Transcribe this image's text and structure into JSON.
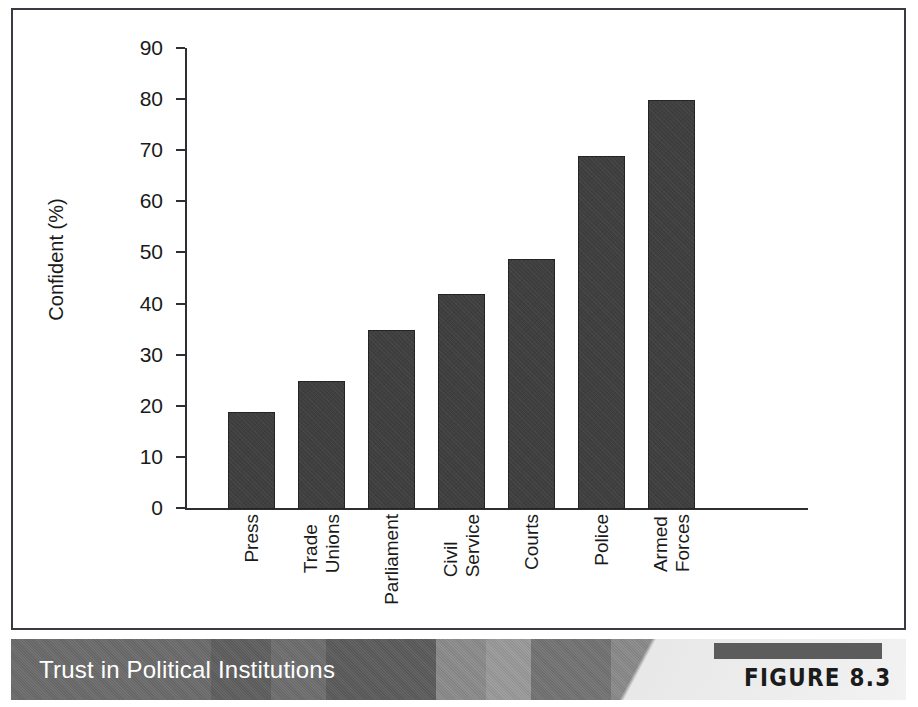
{
  "figure": {
    "caption": "Trust in Political Institutions",
    "tag": "FIGURE 8.3",
    "caption_text_color": "#ffffff",
    "caption_bar_color": "#6f6f6f",
    "tag_text_color": "#1b1b1b"
  },
  "chart_data": {
    "type": "bar",
    "title": "Trust in Political Institutions",
    "xlabel": "",
    "ylabel": "Confident (%)",
    "categories": [
      "Press",
      "Trade Unions",
      "Parliament",
      "Civil Service",
      "Courts",
      "Police",
      "Armed Forces"
    ],
    "category_lines": [
      [
        "Press"
      ],
      [
        "Trade",
        "Unions"
      ],
      [
        "Parliament"
      ],
      [
        "Civil",
        "Service"
      ],
      [
        "Courts"
      ],
      [
        "Police"
      ],
      [
        "Armed",
        "Forces"
      ]
    ],
    "values": [
      19,
      25,
      35,
      42,
      49,
      69,
      80
    ],
    "ylim": [
      0,
      90
    ],
    "yticks": [
      0,
      10,
      20,
      30,
      40,
      50,
      60,
      70,
      80,
      90
    ],
    "ytick_labels": [
      "0",
      "10",
      "20",
      "30",
      "40",
      "50",
      "60",
      "70",
      "80",
      "90"
    ],
    "grid": false,
    "legend": null,
    "bar_color": "#3f3f3f",
    "bar_edge_color": "#242424",
    "axis_color": "#2e2e33"
  }
}
